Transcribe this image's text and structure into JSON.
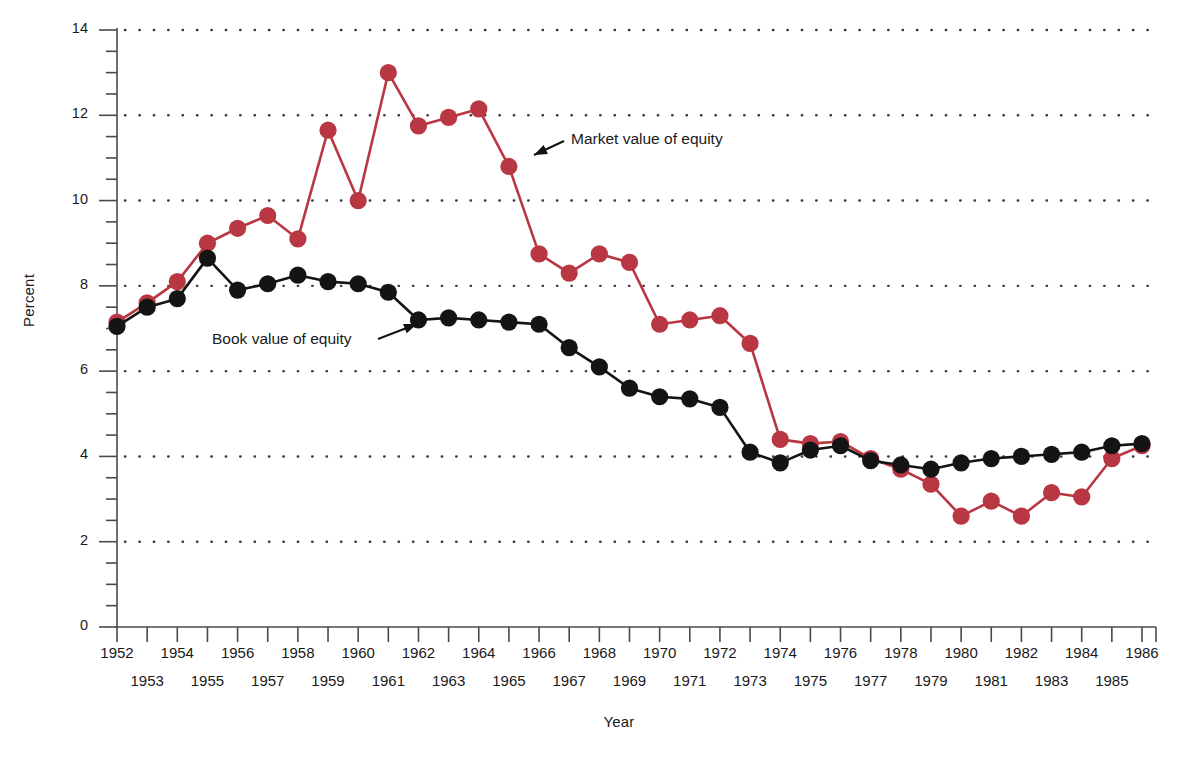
{
  "axes": {
    "ylabel": "Percent",
    "xlabel": "Year",
    "ytick_labels": [
      "14",
      "12",
      "10",
      "8",
      "6",
      "4",
      "2",
      "0"
    ]
  },
  "annotations": {
    "market": "Market value of equity",
    "book": "Book value of equity"
  },
  "colors": {
    "market": "#b93742",
    "book": "#141414",
    "grid": "#3a3a3a",
    "axis": "#4a4a4a"
  },
  "chart_data": {
    "type": "line",
    "title": "",
    "xlabel": "Year",
    "ylabel": "Percent",
    "ylim": [
      0,
      14
    ],
    "yticks": [
      0,
      2,
      4,
      6,
      8,
      10,
      12,
      14
    ],
    "yminor_step": 0.5,
    "grid": "horizontal-dotted",
    "legend": "inline-annotations",
    "x": [
      1952,
      1953,
      1954,
      1955,
      1956,
      1957,
      1958,
      1959,
      1960,
      1961,
      1962,
      1963,
      1964,
      1965,
      1966,
      1967,
      1968,
      1969,
      1970,
      1971,
      1972,
      1973,
      1974,
      1975,
      1976,
      1977,
      1978,
      1979,
      1980,
      1981,
      1982,
      1983,
      1984,
      1985,
      1986
    ],
    "xtick_labels_top": [
      "1952",
      "1954",
      "1956",
      "1958",
      "1960",
      "1962",
      "1964",
      "1966",
      "1968",
      "1970",
      "1972",
      "1974",
      "1976",
      "1978",
      "1980",
      "1982",
      "1984",
      "1986"
    ],
    "xtick_labels_bottom": [
      "1953",
      "1955",
      "1957",
      "1959",
      "1961",
      "1963",
      "1965",
      "1967",
      "1969",
      "1971",
      "1973",
      "1975",
      "1977",
      "1979",
      "1981",
      "1983",
      "1985"
    ],
    "series": [
      {
        "name": "Market value of equity",
        "color": "#b93742",
        "values": [
          7.15,
          7.6,
          8.1,
          9.0,
          9.35,
          9.65,
          9.1,
          11.65,
          10.0,
          13.0,
          11.75,
          11.95,
          12.15,
          10.8,
          8.75,
          8.3,
          8.75,
          8.55,
          7.1,
          7.2,
          7.3,
          6.65,
          4.4,
          4.3,
          4.35,
          3.95,
          3.7,
          3.35,
          2.6,
          2.95,
          2.6,
          3.15,
          3.05,
          3.95,
          4.25
        ]
      },
      {
        "name": "Book value of equity",
        "color": "#141414",
        "values": [
          7.05,
          7.5,
          7.7,
          8.65,
          7.9,
          8.05,
          8.25,
          8.1,
          8.05,
          7.85,
          7.2,
          7.25,
          7.2,
          7.15,
          7.1,
          6.55,
          6.1,
          5.6,
          5.4,
          5.35,
          5.15,
          4.1,
          3.85,
          4.15,
          4.25,
          3.9,
          3.8,
          3.7,
          3.85,
          3.95,
          4.0,
          4.05,
          4.1,
          4.25,
          4.3
        ]
      }
    ]
  }
}
